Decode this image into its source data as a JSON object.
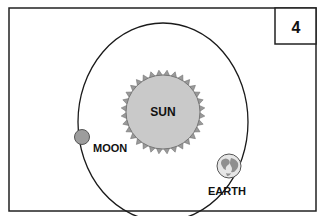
{
  "panel": {
    "number": "4"
  },
  "labels": {
    "sun": "SUN",
    "moon": "MOON",
    "earth": "EARTH"
  },
  "colors": {
    "sun_fill": "#c9c9c9",
    "sun_rays": "#9a9a9a",
    "moon_fill": "#9d9d9d",
    "earth_fill": "#e6e6e6",
    "earth_land": "#8f8f8f",
    "line": "#1a1a1a"
  }
}
